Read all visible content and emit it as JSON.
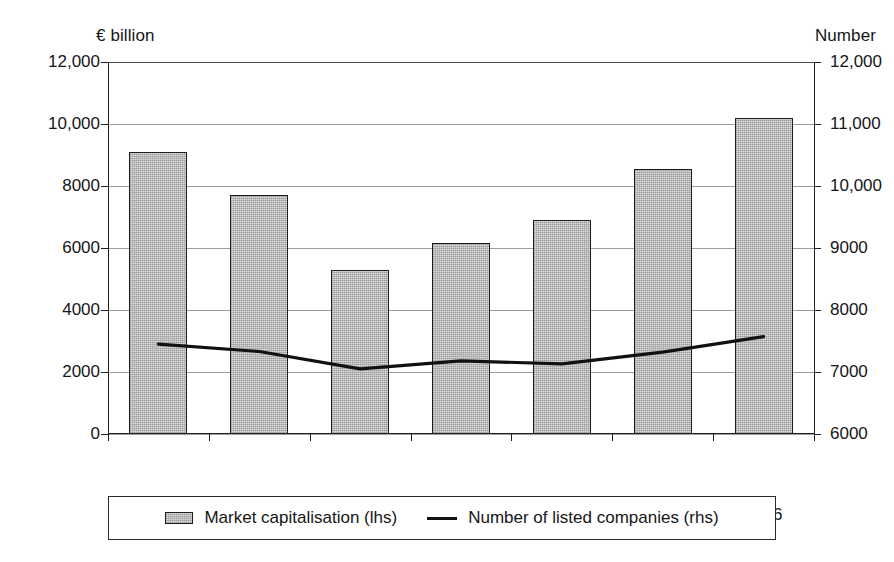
{
  "chart_data": {
    "type": "bar",
    "title": "",
    "categories": [
      "2000",
      "2001",
      "2002",
      "2003",
      "2004",
      "2005",
      "2006"
    ],
    "series": [
      {
        "name": "Market capitalisation (lhs)",
        "type": "bar",
        "axis": "left",
        "values": [
          9100,
          7700,
          5300,
          6150,
          6900,
          8550,
          10200
        ]
      },
      {
        "name": "Number of listed companies (rhs)",
        "type": "line",
        "axis": "right",
        "values": [
          7450,
          7330,
          7050,
          7180,
          7130,
          7320,
          7570
        ]
      }
    ],
    "xlabel": "",
    "ylabel": "€ billion",
    "y2label": "Number",
    "ylim": [
      0,
      12000
    ],
    "y2lim": [
      6000,
      12000
    ],
    "yticks": [
      0,
      2000,
      4000,
      6000,
      8000,
      10000,
      12000
    ],
    "ytick_labels": [
      "0",
      "2000",
      "4000",
      "6000",
      "8000",
      "10,000",
      "12,000"
    ],
    "y2ticks": [
      6000,
      7000,
      8000,
      9000,
      10000,
      11000,
      12000
    ],
    "y2tick_labels": [
      "6000",
      "7000",
      "8000",
      "9000",
      "10,000",
      "11,000",
      "12,000"
    ],
    "grid": true,
    "grid_axis": "y",
    "legend_position": "bottom",
    "legend_entries": [
      {
        "label": "Market capitalisation (lhs)",
        "marker": "bar-swatch-icon"
      },
      {
        "label": "Number of listed companies (rhs)",
        "marker": "line-swatch-icon"
      }
    ],
    "colors": {
      "bar_fill": "#dcdcdc",
      "bar_edge": "#1d1d1d",
      "line": "#111111",
      "grid": "#9d9d9d",
      "axis": "#202020",
      "background": "#ffffff"
    }
  },
  "axes": {
    "left_caption": "€ billion",
    "right_caption": "Number"
  }
}
